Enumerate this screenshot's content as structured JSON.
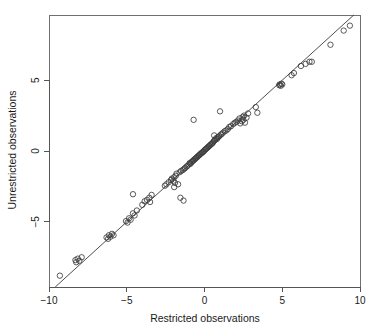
{
  "chart_data": {
    "type": "scatter",
    "title": "",
    "xlabel": "Restricted observations",
    "ylabel": "Unrestricted observations",
    "xlim": [
      -10,
      10
    ],
    "ylim": [
      -9.6,
      9.6
    ],
    "xticks": [
      -10,
      -5,
      0,
      5,
      10
    ],
    "yticks": [
      -5,
      0,
      5
    ],
    "xticklabels": [
      "-10",
      "-5",
      "0",
      "5",
      "10"
    ],
    "yticklabels": [
      "-5",
      "0",
      "5"
    ],
    "grid": false,
    "legend": null,
    "marker": "open-circle",
    "marker_color": "#3c3c3c",
    "reference_line": {
      "type": "identity",
      "description": "y = x diagonal line",
      "slope": 1,
      "intercept": 0,
      "color": "#3a3a3a"
    },
    "series": [
      {
        "name": "observations",
        "points": [
          [
            -9.3,
            -8.8
          ],
          [
            -8.3,
            -7.7
          ],
          [
            -8.25,
            -7.85
          ],
          [
            -8.15,
            -7.6
          ],
          [
            -8.05,
            -7.75
          ],
          [
            -7.9,
            -7.5
          ],
          [
            -6.3,
            -6.1
          ],
          [
            -6.2,
            -6.2
          ],
          [
            -6.15,
            -5.95
          ],
          [
            -6.05,
            -6.05
          ],
          [
            -5.95,
            -5.85
          ],
          [
            -5.85,
            -5.95
          ],
          [
            -5.05,
            -4.95
          ],
          [
            -4.95,
            -5.05
          ],
          [
            -4.85,
            -4.75
          ],
          [
            -4.75,
            -4.85
          ],
          [
            -4.6,
            -4.4
          ],
          [
            -4.5,
            -4.55
          ],
          [
            -4.35,
            -4.2
          ],
          [
            -4.6,
            -3.05
          ],
          [
            -4.0,
            -3.8
          ],
          [
            -3.85,
            -3.55
          ],
          [
            -3.7,
            -3.45
          ],
          [
            -3.55,
            -3.3
          ],
          [
            -3.5,
            -3.6
          ],
          [
            -3.4,
            -3.1
          ],
          [
            -2.55,
            -2.45
          ],
          [
            -2.45,
            -2.35
          ],
          [
            -2.3,
            -2.2
          ],
          [
            -2.15,
            -2.05
          ],
          [
            -2.1,
            -1.95
          ],
          [
            -2.0,
            -2.1
          ],
          [
            -1.95,
            -1.85
          ],
          [
            -1.9,
            -2.25
          ],
          [
            -1.85,
            -1.75
          ],
          [
            -1.8,
            -1.6
          ],
          [
            -1.95,
            -2.55
          ],
          [
            -1.7,
            -2.35
          ],
          [
            -1.6,
            -1.5
          ],
          [
            -1.55,
            -3.3
          ],
          [
            -1.35,
            -3.5
          ],
          [
            -1.5,
            -1.4
          ],
          [
            -1.4,
            -1.35
          ],
          [
            -1.3,
            -1.25
          ],
          [
            -1.25,
            -1.2
          ],
          [
            -1.15,
            -1.1
          ],
          [
            -1.1,
            -1.05
          ],
          [
            -1.0,
            -0.95
          ],
          [
            -0.95,
            -0.85
          ],
          [
            -0.9,
            -0.9
          ],
          [
            -0.85,
            -0.8
          ],
          [
            -0.8,
            -0.75
          ],
          [
            -0.75,
            -0.7
          ],
          [
            -0.7,
            -0.65
          ],
          [
            -0.7,
            2.2
          ],
          [
            -0.65,
            -0.6
          ],
          [
            -0.6,
            -0.55
          ],
          [
            -0.55,
            -0.5
          ],
          [
            -0.5,
            -0.45
          ],
          [
            -0.45,
            -0.4
          ],
          [
            -0.4,
            -0.35
          ],
          [
            -0.35,
            -0.3
          ],
          [
            -0.3,
            -0.25
          ],
          [
            -0.25,
            -0.2
          ],
          [
            -0.2,
            -0.15
          ],
          [
            -0.15,
            -0.1
          ],
          [
            -0.1,
            -0.08
          ],
          [
            -0.05,
            -0.02
          ],
          [
            0.0,
            0.05
          ],
          [
            0.05,
            0.1
          ],
          [
            0.1,
            0.15
          ],
          [
            0.15,
            0.2
          ],
          [
            0.2,
            0.25
          ],
          [
            0.25,
            0.3
          ],
          [
            0.3,
            0.35
          ],
          [
            0.35,
            0.4
          ],
          [
            0.4,
            0.45
          ],
          [
            0.45,
            0.5
          ],
          [
            0.5,
            0.55
          ],
          [
            0.55,
            0.6
          ],
          [
            0.6,
            0.7
          ],
          [
            0.62,
            1.1
          ],
          [
            0.65,
            0.75
          ],
          [
            0.7,
            0.8
          ],
          [
            0.75,
            0.9
          ],
          [
            0.8,
            0.85
          ],
          [
            0.85,
            0.95
          ],
          [
            0.9,
            1.0
          ],
          [
            0.95,
            1.05
          ],
          [
            1.0,
            2.8
          ],
          [
            1.05,
            1.15
          ],
          [
            1.1,
            1.2
          ],
          [
            1.2,
            1.3
          ],
          [
            1.3,
            1.4
          ],
          [
            1.4,
            1.45
          ],
          [
            1.5,
            1.55
          ],
          [
            1.6,
            1.7
          ],
          [
            1.7,
            1.75
          ],
          [
            1.85,
            1.9
          ],
          [
            1.95,
            2.0
          ],
          [
            2.05,
            2.05
          ],
          [
            2.15,
            2.15
          ],
          [
            2.25,
            2.3
          ],
          [
            2.3,
            1.95
          ],
          [
            2.4,
            2.1
          ],
          [
            2.45,
            2.4
          ],
          [
            2.5,
            2.2
          ],
          [
            2.55,
            2.5
          ],
          [
            2.6,
            2.0
          ],
          [
            2.7,
            2.35
          ],
          [
            2.8,
            2.65
          ],
          [
            3.3,
            3.1
          ],
          [
            3.4,
            2.7
          ],
          [
            4.8,
            4.65
          ],
          [
            4.85,
            4.7
          ],
          [
            4.9,
            4.6
          ],
          [
            4.95,
            4.75
          ],
          [
            5.0,
            4.7
          ],
          [
            5.6,
            5.35
          ],
          [
            5.75,
            5.5
          ],
          [
            6.2,
            6.0
          ],
          [
            6.5,
            6.15
          ],
          [
            6.75,
            6.3
          ],
          [
            6.9,
            6.3
          ],
          [
            8.1,
            7.5
          ],
          [
            8.95,
            8.5
          ],
          [
            9.35,
            8.85
          ]
        ]
      }
    ]
  },
  "axes": {
    "x_title": "Restricted observations",
    "y_title": "Unrestricted observations"
  }
}
